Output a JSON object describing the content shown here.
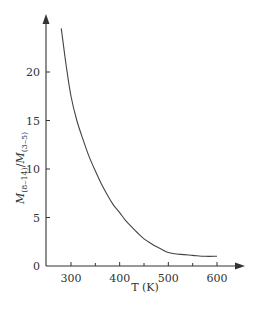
{
  "chart_data": {
    "type": "line",
    "title": "",
    "xlabel": "T (K)",
    "ylabel": "M(8–14)/M(3–5)",
    "ylabel_parts": {
      "m1": "M",
      "s1": "(8–14)",
      "slash": "/",
      "m2": "M",
      "s2": "(3–5)"
    },
    "xlim": [
      250,
      650
    ],
    "ylim": [
      0,
      25
    ],
    "xticks": [
      300,
      400,
      500,
      600
    ],
    "xticks_minor": [
      350,
      450,
      550
    ],
    "yticks": [
      0,
      5,
      10,
      15,
      20
    ],
    "grid": false,
    "legend": null,
    "series": [
      {
        "name": "M(8-14)/M(3-5)",
        "x": [
          280,
          290,
          300,
          312,
          325,
          337,
          350,
          362,
          375,
          387,
          400,
          412,
          425,
          437,
          450,
          462,
          475,
          487,
          500,
          525,
          550,
          575,
          600
        ],
        "values": [
          24.5,
          20.7,
          17.5,
          15.0,
          13.0,
          11.3,
          9.8,
          8.5,
          7.3,
          6.3,
          5.5,
          4.7,
          4.0,
          3.4,
          2.8,
          2.4,
          2.0,
          1.7,
          1.4,
          1.2,
          1.1,
          1.0,
          1.0
        ]
      }
    ]
  },
  "colors": {
    "axis": "#333333",
    "line": "#444444",
    "background": "#ffffff"
  }
}
